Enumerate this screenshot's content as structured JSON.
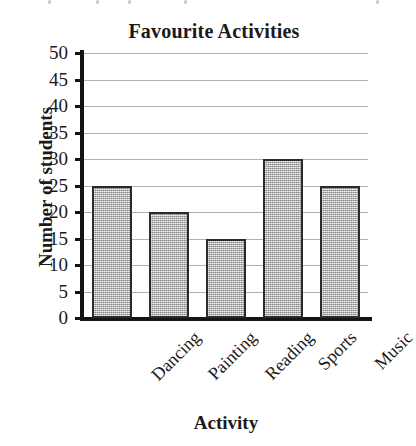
{
  "chart_data": {
    "type": "bar",
    "title": "Favourite Activities",
    "xlabel": "Activity",
    "ylabel": "Number of students",
    "categories": [
      "Dancing",
      "Painting",
      "Reading",
      "Sports",
      "Music"
    ],
    "values": [
      25,
      20,
      15,
      30,
      25
    ],
    "ylim": [
      0,
      50
    ],
    "ytick_step": 5,
    "ytick_labels": [
      "0",
      "5",
      "10",
      "15",
      "20",
      "25",
      "30",
      "35",
      "40",
      "45",
      "50"
    ],
    "grid": "horizontal",
    "legend": "none",
    "xtick_label_rotation": -45,
    "bar_fill_color": "#b3b3b3",
    "bar_edge_color": "#2b2b2b",
    "gridline_color": "#b2b2b2",
    "axis_color": "#141414",
    "background_color": "#ffffff"
  }
}
